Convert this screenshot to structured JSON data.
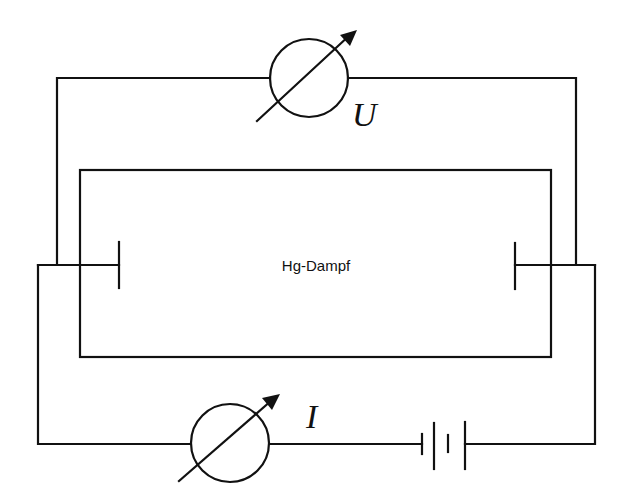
{
  "diagram": {
    "type": "circuit-schematic",
    "tube_label": "Hg-Dampf",
    "voltmeter_label": "U",
    "ammeter_label": "I",
    "components": [
      {
        "name": "voltmeter",
        "symbol": "adjustable-meter",
        "label": "U"
      },
      {
        "name": "ammeter",
        "symbol": "adjustable-meter",
        "label": "I"
      },
      {
        "name": "battery",
        "symbol": "battery-cells"
      },
      {
        "name": "tube",
        "symbol": "rectangle-enclosure",
        "label": "Hg-Dampf"
      },
      {
        "name": "left-electrode",
        "symbol": "plate"
      },
      {
        "name": "right-electrode",
        "symbol": "plate"
      }
    ],
    "colors": {
      "line": "#111111",
      "background": "#ffffff"
    }
  }
}
